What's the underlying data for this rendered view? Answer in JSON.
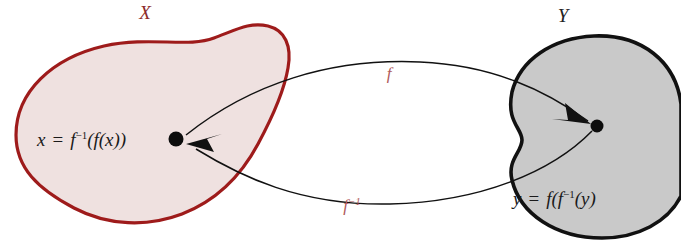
{
  "figure": {
    "background_color": "#ffffff"
  },
  "sets": [
    {
      "id": "X",
      "label": "X",
      "label_color": "#8c2a2a",
      "fill_color": "#efe1e0",
      "stroke_color": "#9e1b1b",
      "label_x": 145,
      "label_y": 19
    },
    {
      "id": "Y",
      "label": "Y",
      "label_color": "#222222",
      "fill_color": "#c9c9c9",
      "stroke_color": "#111111",
      "label_x": 563,
      "label_y": 22
    }
  ],
  "elements": [
    {
      "id": "x-point",
      "set": "X",
      "dot_x": 176,
      "dot_y": 139,
      "equation_parts": {
        "variable": "x",
        "equals": "=",
        "expression_pre": "f",
        "expression_sup": "−1",
        "expression_post": "(f(x))"
      },
      "equation_plain": "x = f−1(f(x))",
      "text_x": 37,
      "text_y": 146
    },
    {
      "id": "y-point",
      "set": "Y",
      "dot_x": 597,
      "dot_y": 126,
      "equation_parts": {
        "variable": "y",
        "equals": "=",
        "expression_pre": "f(f",
        "expression_sup": "−1",
        "expression_post": "(y)"
      },
      "equation_plain": "y = f(f−1(y)",
      "text_x": 513,
      "text_y": 205
    }
  ],
  "arrows": [
    {
      "id": "forward-map",
      "label": "f",
      "label_sup": "",
      "label_color": "#b05a5a",
      "label_x": 389,
      "label_y": 79,
      "direction": "X to Y",
      "stroke_color": "#111111"
    },
    {
      "id": "inverse-map",
      "label": "f",
      "label_sup": "−1",
      "label_color": "#b05a5a",
      "label_x": 355,
      "label_y": 211,
      "direction": "Y to X",
      "stroke_color": "#111111"
    }
  ]
}
